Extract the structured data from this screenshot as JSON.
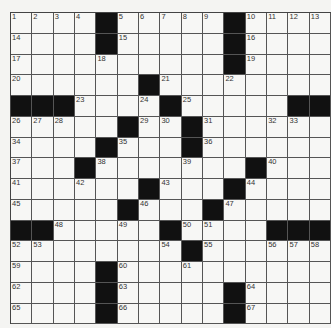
{
  "puzzle": {
    "rows": 15,
    "cols": 15,
    "grid": [
      [
        "1",
        "2",
        "3",
        "4",
        "#",
        "5",
        "6",
        "7",
        "8",
        "9",
        "#",
        "10",
        "11",
        "12",
        "13"
      ],
      [
        "14",
        "",
        "",
        "",
        "#",
        "15",
        "",
        "",
        "",
        "",
        "#",
        "16",
        "",
        "",
        ""
      ],
      [
        "17",
        "",
        "",
        "",
        "18",
        "",
        "",
        "",
        "",
        "",
        "#",
        "19",
        "",
        "",
        ""
      ],
      [
        "20",
        "",
        "",
        "",
        "",
        "",
        "#",
        "21",
        "",
        "",
        "22",
        "",
        "",
        "",
        ""
      ],
      [
        "#",
        "#",
        "#",
        "23",
        "",
        "",
        "24",
        "#",
        "25",
        "",
        "",
        "",
        "",
        "#",
        "#"
      ],
      [
        "26",
        "27",
        "28",
        "",
        "",
        "#",
        "29",
        "30",
        "#",
        "31",
        "",
        "",
        "32",
        "33",
        ""
      ],
      [
        "34",
        "",
        "",
        "",
        "#",
        "35",
        "",
        "",
        "#",
        "36",
        "",
        "",
        "",
        "",
        ""
      ],
      [
        "37",
        "",
        "",
        "#",
        "38",
        "",
        "",
        "",
        "39",
        "",
        "",
        "#",
        "40",
        "",
        ""
      ],
      [
        "41",
        "",
        "",
        "42",
        "",
        "",
        "#",
        "43",
        "",
        "",
        "#",
        "44",
        "",
        "",
        ""
      ],
      [
        "45",
        "",
        "",
        "",
        "",
        "#",
        "46",
        "",
        "",
        "#",
        "47",
        "",
        "",
        "",
        ""
      ],
      [
        "#",
        "#",
        "48",
        "",
        "",
        "49",
        "",
        "#",
        "50",
        "51",
        "",
        "",
        "#",
        "#",
        "#"
      ],
      [
        "52",
        "53",
        "",
        "",
        "",
        "",
        "",
        "54",
        "#",
        "55",
        "",
        "",
        "56",
        "57",
        "58"
      ],
      [
        "59",
        "",
        "",
        "",
        "#",
        "60",
        "",
        "",
        "61",
        "",
        "",
        "",
        "",
        "",
        ""
      ],
      [
        "62",
        "",
        "",
        "",
        "#",
        "63",
        "",
        "",
        "",
        "",
        "#",
        "64",
        "",
        "",
        ""
      ],
      [
        "65",
        "",
        "",
        "",
        "#",
        "66",
        "",
        "",
        "",
        "",
        "#",
        "67",
        "",
        "",
        ""
      ]
    ]
  },
  "colors": {
    "black_square": "#111111",
    "white_square": "#f7f7f5",
    "grid_line": "#555555"
  }
}
